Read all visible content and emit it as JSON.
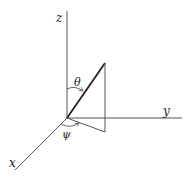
{
  "diagram": {
    "type": "3d-axes-angle-diagram",
    "axes": {
      "x": {
        "label": "x"
      },
      "y": {
        "label": "y"
      },
      "z": {
        "label": "z"
      }
    },
    "angles": {
      "theta": {
        "label": "θ",
        "description": "polar angle from z-axis"
      },
      "psi": {
        "label": "ψ",
        "description": "azimuthal angle from x-axis"
      }
    },
    "colors": {
      "line": "#444444",
      "bold_line": "#222222",
      "background": "#ffffff"
    }
  }
}
